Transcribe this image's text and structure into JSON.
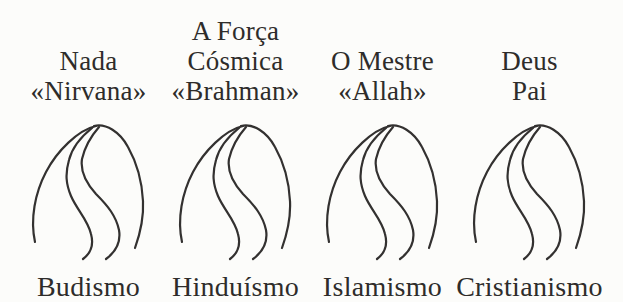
{
  "diagram": {
    "columns": [
      {
        "concept_line1": "",
        "concept_line2": "Nada",
        "concept_line3": "«Nirvana»",
        "religion": "Budismo"
      },
      {
        "concept_line1": "A Força",
        "concept_line2": "Cósmica",
        "concept_line3": "«Brahman»",
        "religion": "Hinduísmo"
      },
      {
        "concept_line1": "",
        "concept_line2": "O Mestre",
        "concept_line3": "«Allah»",
        "religion": "Islamismo"
      },
      {
        "concept_line1": "",
        "concept_line2": "Deus",
        "concept_line3": "Pai",
        "religion": "Cristianismo"
      }
    ],
    "icon": "mountain-winding-path-icon",
    "colors": {
      "ink": "#333130",
      "background": "#fcfcfa"
    }
  }
}
